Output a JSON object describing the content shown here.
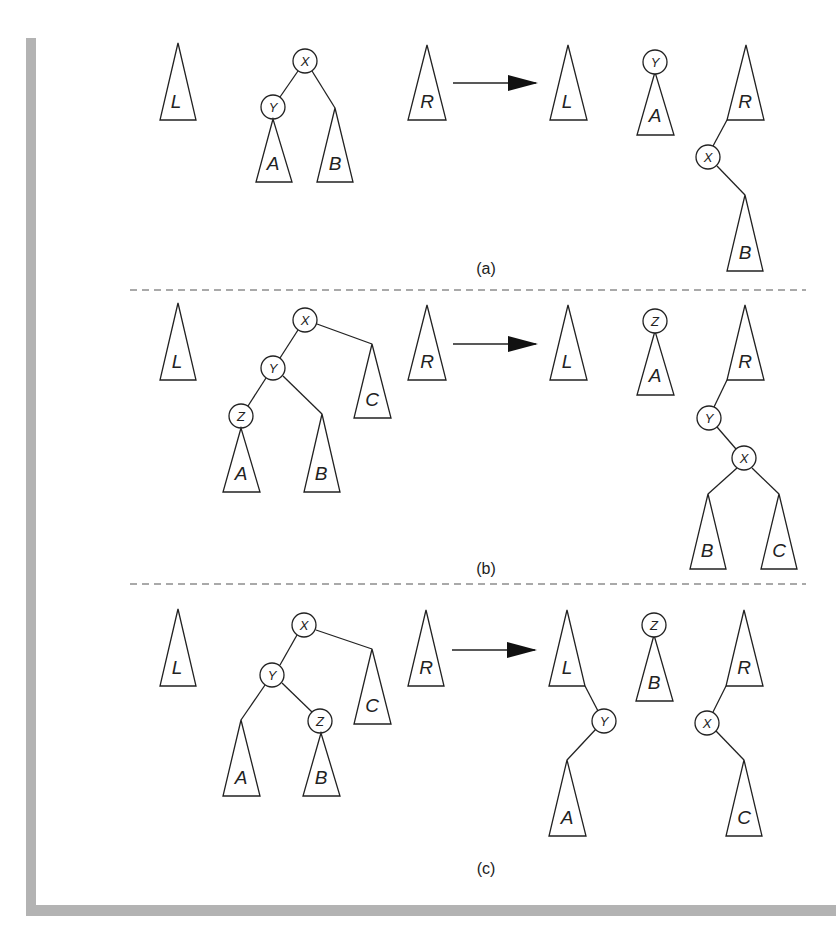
{
  "figure": {
    "panels": [
      {
        "caption": "(a)",
        "case": "zig",
        "before": {
          "left_tree": "L",
          "root": "X",
          "nodes": [
            "X",
            "Y"
          ],
          "subtrees": [
            "A",
            "B"
          ],
          "right_tree": "R"
        },
        "after": {
          "left_tree": "L",
          "middle_root": "Y",
          "middle_subtrees": [
            "A"
          ],
          "right_tree": "R",
          "right_attached_nodes": [
            "X"
          ],
          "right_attached_subtrees": [
            "B"
          ]
        }
      },
      {
        "caption": "(b)",
        "case": "zig-zig",
        "before": {
          "left_tree": "L",
          "root": "X",
          "nodes": [
            "X",
            "Y",
            "Z"
          ],
          "subtrees": [
            "A",
            "B",
            "C"
          ],
          "right_tree": "R"
        },
        "after": {
          "left_tree": "L",
          "middle_root": "Z",
          "middle_subtrees": [
            "A"
          ],
          "right_tree": "R",
          "right_attached_nodes": [
            "Y",
            "X"
          ],
          "right_attached_subtrees": [
            "B",
            "C"
          ]
        }
      },
      {
        "caption": "(c)",
        "case": "zig-zag",
        "before": {
          "left_tree": "L",
          "root": "X",
          "nodes": [
            "X",
            "Y",
            "Z"
          ],
          "subtrees": [
            "A",
            "B",
            "C"
          ],
          "right_tree": "R"
        },
        "after": {
          "left_tree": "L",
          "left_attached_nodes": [
            "Y"
          ],
          "left_attached_subtrees": [
            "A"
          ],
          "middle_root": "Z",
          "middle_subtrees": [
            "B"
          ],
          "right_tree": "R",
          "right_attached_nodes": [
            "X"
          ],
          "right_attached_subtrees": [
            "C"
          ]
        }
      }
    ],
    "labels": {
      "L": "L",
      "R": "R",
      "A": "A",
      "B": "B",
      "C": "C",
      "X": "X",
      "Y": "Y",
      "Z": "Z"
    },
    "colors": {
      "ink": "#222222",
      "frame": "#b3b3b3",
      "dash": "#555555",
      "background": "#ffffff"
    }
  }
}
